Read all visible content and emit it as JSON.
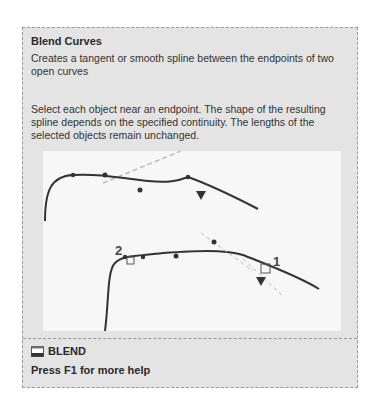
{
  "tooltip": {
    "title": "Blend Curves",
    "description": "Creates a tangent or smooth spline between the endpoints of two open curves",
    "detail": "Select each object near an endpoint. The shape of the resulting spline depends on the specified continuity. The lengths of the selected objects remain unchanged.",
    "figure": {
      "label_1": "1",
      "label_2": "2"
    },
    "command": {
      "icon": "blend-command-icon",
      "name": "BLEND"
    },
    "help_text": "Press F1 for more help"
  }
}
